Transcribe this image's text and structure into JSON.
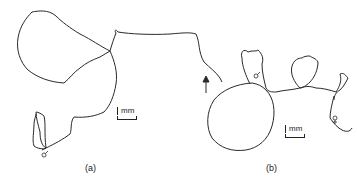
{
  "figure": {
    "panels": [
      {
        "id": "a",
        "label": "(a)",
        "scale_bar": "mm",
        "symbols": [
          "male-symbol"
        ],
        "arrow": "direction-arrow"
      },
      {
        "id": "b",
        "label": "(b)",
        "scale_bar": "mm",
        "symbols": [
          "male-symbol",
          "female-symbol"
        ]
      }
    ],
    "stroke_color": "#2a2a2a"
  }
}
